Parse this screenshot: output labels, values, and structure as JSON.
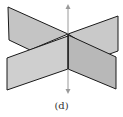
{
  "figure": {
    "caption": "(d)",
    "colors": {
      "plane_fill_light": "#c8c8c8",
      "plane_fill_dark": "#b4b4b4",
      "edge": "#1a1a1a",
      "axis": "#9a9a9a",
      "background": "#ffffff"
    }
  }
}
